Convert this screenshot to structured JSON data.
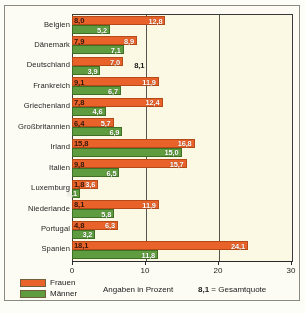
{
  "chart_data": {
    "type": "bar",
    "orientation": "horizontal",
    "title": "",
    "xlabel": "Angaben in Prozent",
    "ylabel": "",
    "xlim": [
      0,
      30
    ],
    "xticks": [
      0,
      10,
      20,
      30
    ],
    "xtick_labels": [
      "0",
      "10",
      "20",
      "30"
    ],
    "grid": true,
    "gridlines_at": [
      10,
      20
    ],
    "legend_position": "bottom-left",
    "categories": [
      "Belgien",
      "Dänemark",
      "Deutschland",
      "Frankreich",
      "Griechenland",
      "Großbritannien",
      "Irland",
      "Italien",
      "Luxemburg",
      "Niederlande",
      "Portugal",
      "Spanien"
    ],
    "series": [
      {
        "name": "Frauen",
        "color": "#e8622a",
        "values": [
          12.8,
          8.9,
          7.0,
          11.9,
          12.4,
          5.7,
          16.8,
          15.7,
          3.6,
          11.9,
          6.3,
          24.1
        ],
        "labels": [
          "12,8",
          "8,9",
          "7,0",
          "11,9",
          "12,4",
          "5,7",
          "16,8",
          "15,7",
          "3,6",
          "11,9",
          "6,3",
          "24,1"
        ]
      },
      {
        "name": "Männer",
        "color": "#5f9c3f",
        "values": [
          5.2,
          7.1,
          3.9,
          6.7,
          4.6,
          6.9,
          15.0,
          6.5,
          1.1,
          5.8,
          3.2,
          11.8
        ],
        "labels": [
          "5,2",
          "7,1",
          "3,9",
          "6,7",
          "4,6",
          "6,9",
          "15,0",
          "6,5",
          "1,1",
          "5,8",
          "3,2",
          "11,8"
        ]
      }
    ],
    "total_rate": {
      "name": "Gesamtquote",
      "values": [
        8.0,
        7.9,
        8.1,
        9.1,
        7.8,
        6.4,
        15.8,
        9.8,
        1.8,
        8.1,
        4.8,
        18.1
      ],
      "labels": [
        "8,0",
        "7,9",
        "8,1",
        "9,1",
        "7,8",
        "6,4",
        "15,8",
        "9,8",
        "1,8",
        "8,1",
        "4,8",
        "18,1"
      ]
    },
    "legend": [
      {
        "label": "Frauen",
        "color": "#e8622a"
      },
      {
        "label": "Männer",
        "color": "#5f9c3f"
      }
    ],
    "notes": {
      "units": "Angaben in Prozent",
      "quote_sample": "8,1",
      "quote_equals": "= Gesamtquote"
    }
  }
}
